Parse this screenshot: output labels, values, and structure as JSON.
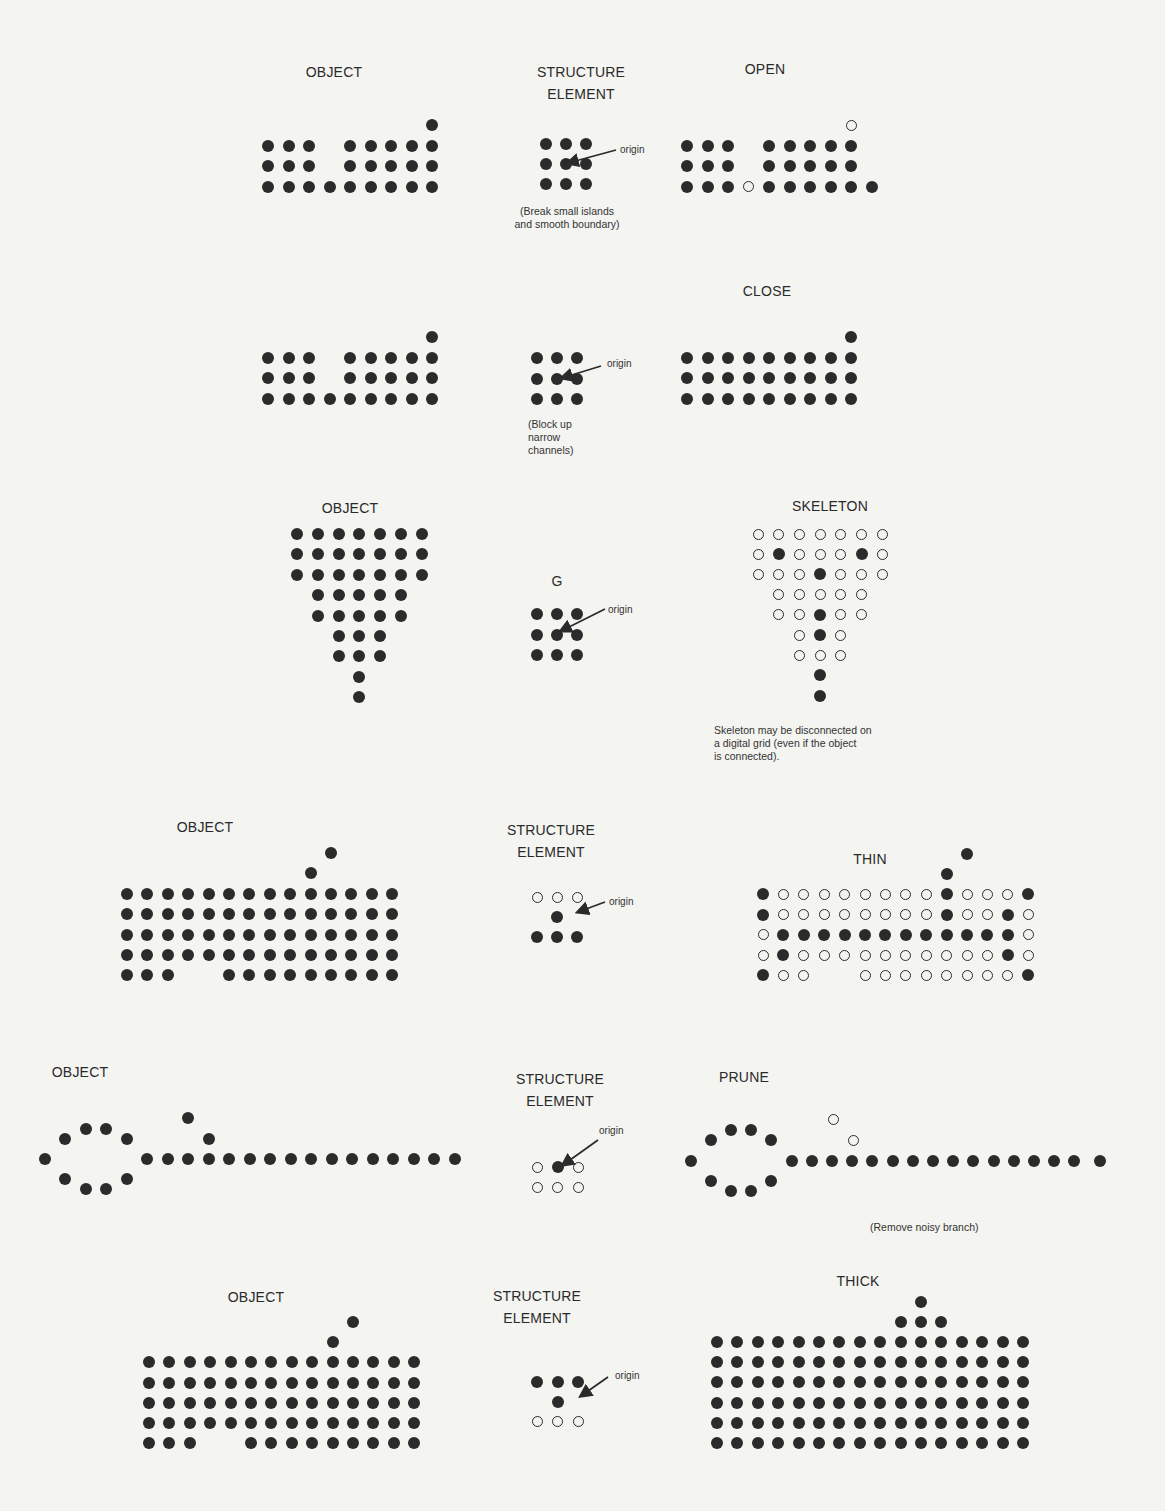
{
  "colors": {
    "background": "#f4f4f1",
    "ink": "#2b2b2b"
  },
  "panels": [
    {
      "id": "open",
      "object_label": "OBJECT",
      "element_label": "STRUCTURE\nELEMENT",
      "result_label": "OPEN",
      "element_note": "(Break small islands\nand smooth boundary)",
      "origin_label": "origin"
    },
    {
      "id": "close",
      "object_label": "",
      "element_label": "",
      "result_label": "CLOSE",
      "element_note": "(Block up\nnarrow\nchannels)",
      "origin_label": "origin"
    },
    {
      "id": "skeleton",
      "object_label": "OBJECT",
      "element_label": "G",
      "result_label": "SKELETON",
      "result_note": "Skeleton may be disconnected on\na digital grid (even if the object\nis connected).",
      "origin_label": "origin"
    },
    {
      "id": "thin",
      "object_label": "OBJECT",
      "element_label": "STRUCTURE\nELEMENT",
      "result_label": "THIN",
      "origin_label": "origin"
    },
    {
      "id": "prune",
      "object_label": "OBJECT",
      "element_label": "STRUCTURE\nELEMENT",
      "result_label": "PRUNE",
      "result_note": "(Remove noisy branch)",
      "origin_label": "origin"
    },
    {
      "id": "thick",
      "object_label": "OBJECT",
      "element_label": "STRUCTURE\nELEMENT",
      "result_label": "THICK",
      "origin_label": "origin"
    }
  ],
  "grids": {
    "open_object": {
      "x0": 268,
      "dx": 20.5,
      "y0": 125,
      "dy": 20.5,
      "rows": [
        "........1",
        "111.11111",
        "111.11111",
        "111111111"
      ]
    },
    "open_element": {
      "x0": 546,
      "dx": 20,
      "y0": 144,
      "dy": 20,
      "rows": [
        "111",
        "111",
        "111"
      ]
    },
    "open_result": {
      "x0": 687,
      "dx": 20.5,
      "y0": 125,
      "dy": 20.5,
      "rows": [
        "........0",
        "111.11111",
        "111.11111",
        "1110111111"
      ]
    },
    "close_object": {
      "x0": 268,
      "dx": 20.5,
      "y0": 337,
      "dy": 20.5,
      "rows": [
        "........1",
        "111.11111",
        "111.11111",
        "111111111"
      ]
    },
    "close_element": {
      "x0": 537,
      "dx": 20,
      "y0": 358,
      "dy": 20.5,
      "rows": [
        "111",
        "111",
        "111"
      ]
    },
    "close_result": {
      "x0": 687,
      "dx": 20.5,
      "y0": 337,
      "dy": 20.5,
      "rows": [
        "........1",
        "111111111",
        "111111111",
        "111111111"
      ]
    },
    "skel_object": {
      "x0": 297,
      "dx": 20.8,
      "y0": 534,
      "dy": 20.4,
      "rows": [
        "1111111",
        "1111111",
        "1111111",
        ".11111.",
        ".11111.",
        "..111..",
        "..111..",
        "...1...",
        "...1..."
      ]
    },
    "skel_element": {
      "x0": 537,
      "dx": 20,
      "y0": 614,
      "dy": 20.5,
      "rows": [
        "111",
        "111",
        "111"
      ]
    },
    "skel_result": {
      "x0": 758,
      "dx": 20.7,
      "y0": 534,
      "dy": 20.2,
      "rows": [
        "0000000",
        "0100010",
        "0001000",
        ".00000.",
        ".00100.",
        "..010..",
        "..000..",
        "...1...",
        "...1..."
      ]
    },
    "thin_object": {
      "x0": 127,
      "dx": 20.4,
      "y0": 853,
      "dy": 20.4,
      "rows": [
        "..........1...",
        ".........1....",
        "11111111111111",
        "11111111111111",
        "11111111111111",
        "11111111111111",
        "111..111111111"
      ]
    },
    "thin_element": {
      "x0": 537,
      "dx": 20,
      "y0": 897,
      "dy": 20,
      "rows": [
        "000",
        ".1.",
        "111"
      ]
    },
    "thin_result": {
      "x0": 763,
      "dx": 20.4,
      "y0": 854,
      "dy": 20.2,
      "rows": [
        "..........1...",
        ".........1....",
        "10000000010001",
        "10000000010010",
        "01111111111110",
        "01000000000010",
        "100..000000001"
      ]
    },
    "prune_element": {
      "x0": 537,
      "dx": 20.5,
      "y0": 1167,
      "dy": 20.5,
      "rows": [
        "010",
        "000"
      ]
    },
    "thick_object": {
      "x0": 149,
      "dx": 20.4,
      "y0": 1322,
      "dy": 20.2,
      "rows": [
        "..........1...",
        ".........1....",
        "11111111111111",
        "11111111111111",
        "11111111111111",
        "11111111111111",
        "111..111111111"
      ]
    },
    "thick_element": {
      "x0": 537,
      "dx": 20.5,
      "y0": 1382,
      "dy": 19.8,
      "rows": [
        "111",
        ".1.",
        "000"
      ]
    },
    "thick_result": {
      "x0": 717,
      "dx": 20.4,
      "y0": 1302,
      "dy": 20.1,
      "rows": [
        "..........1.....",
        ".........111....",
        "1111111111111111",
        "1111111111111111",
        "1111111111111111",
        "1111111111111111",
        "1111111111111111",
        "1111111111111111"
      ]
    }
  },
  "prune_points": {
    "object": [
      [
        45,
        1159
      ],
      [
        65,
        1139
      ],
      [
        86,
        1129
      ],
      [
        106,
        1129
      ],
      [
        127,
        1139
      ],
      [
        65,
        1179
      ],
      [
        86,
        1189
      ],
      [
        106,
        1189
      ],
      [
        127,
        1179
      ],
      [
        147,
        1159
      ],
      [
        168,
        1159
      ],
      [
        188,
        1159
      ],
      [
        209,
        1159
      ],
      [
        229,
        1159
      ],
      [
        250,
        1159
      ],
      [
        270,
        1159
      ],
      [
        291,
        1159
      ],
      [
        311,
        1159
      ],
      [
        332,
        1159
      ],
      [
        352,
        1159
      ],
      [
        373,
        1159
      ],
      [
        393,
        1159
      ],
      [
        414,
        1159
      ],
      [
        434,
        1159
      ],
      [
        455,
        1159
      ],
      [
        188,
        1118,
        "1"
      ],
      [
        209,
        1139,
        "1"
      ]
    ],
    "result": [
      [
        691,
        1161
      ],
      [
        711,
        1140
      ],
      [
        731,
        1130
      ],
      [
        751,
        1130
      ],
      [
        771,
        1140
      ],
      [
        711,
        1181
      ],
      [
        731,
        1191
      ],
      [
        751,
        1191
      ],
      [
        771,
        1181
      ],
      [
        792,
        1161
      ],
      [
        812,
        1161
      ],
      [
        832,
        1161
      ],
      [
        852,
        1161
      ],
      [
        872,
        1161
      ],
      [
        893,
        1161
      ],
      [
        913,
        1161
      ],
      [
        933,
        1161
      ],
      [
        953,
        1161
      ],
      [
        973,
        1161
      ],
      [
        994,
        1161
      ],
      [
        1014,
        1161
      ],
      [
        1034,
        1161
      ],
      [
        1054,
        1161
      ],
      [
        1074,
        1161
      ],
      [
        1100,
        1161
      ],
      [
        833,
        1119,
        "0"
      ],
      [
        853,
        1140,
        "0"
      ]
    ]
  },
  "arrows": [
    {
      "panel": "open",
      "from": [
        616,
        150
      ],
      "to": [
        568,
        163
      ],
      "text_pos": [
        621,
        144
      ]
    },
    {
      "panel": "close",
      "from": [
        601,
        366
      ],
      "to": [
        562,
        378
      ],
      "text_pos": [
        606,
        358
      ]
    },
    {
      "panel": "skeleton",
      "from": [
        605,
        609
      ],
      "to": [
        561,
        631
      ],
      "text_pos": [
        610,
        604
      ]
    },
    {
      "panel": "thin",
      "from": [
        605,
        902
      ],
      "to": [
        578,
        912
      ],
      "text_pos": [
        610,
        896
      ]
    },
    {
      "panel": "prune",
      "from": [
        598,
        1140
      ],
      "to": [
        563,
        1165
      ],
      "text_pos": [
        599,
        1126
      ]
    },
    {
      "panel": "thick",
      "from": [
        608,
        1377
      ],
      "to": [
        581,
        1396
      ],
      "text_pos": [
        614,
        1371
      ]
    }
  ]
}
